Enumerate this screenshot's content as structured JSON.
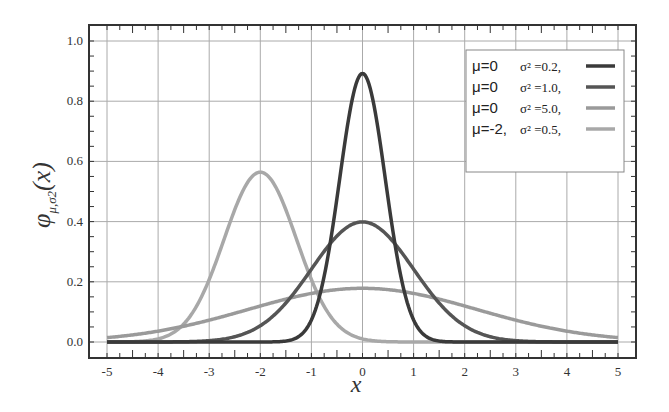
{
  "chart_data": {
    "type": "line",
    "title": "",
    "xlabel": "x",
    "ylabel": "φ μ,σ2 (x)",
    "xlim": [
      -5,
      5
    ],
    "ylim": [
      0,
      1.0
    ],
    "grid": true,
    "legend_position": "upper right",
    "x_ticks": [
      "-5",
      "-4",
      "-3",
      "-2",
      "-1",
      "0",
      "1",
      "2",
      "3",
      "4",
      "5"
    ],
    "y_ticks": [
      "0.0",
      "0.2",
      "0.4",
      "0.6",
      "0.8",
      "1.0"
    ],
    "series": [
      {
        "name": "μ=0  σ² =0.2,",
        "mu": 0,
        "variance": 0.2,
        "color": "#3a3a3a",
        "peak": 0.89
      },
      {
        "name": "μ=0  σ² =1.0,",
        "mu": 0,
        "variance": 1.0,
        "color": "#555555",
        "peak": 0.4
      },
      {
        "name": "μ=0  σ² =5.0,",
        "mu": 0,
        "variance": 5.0,
        "color": "#9a9a9a",
        "peak": 0.18
      },
      {
        "name": "μ=-2, σ² =0.5,",
        "mu": -2,
        "variance": 0.5,
        "color": "#a8a8a8",
        "peak": 0.56
      }
    ],
    "legend": [
      {
        "mu": "μ=0",
        "sigma": "σ² =0.2,"
      },
      {
        "mu": "μ=0",
        "sigma": "σ² =1.0,"
      },
      {
        "mu": "μ=0",
        "sigma": "σ² =5.0,"
      },
      {
        "mu": "μ=-2,",
        "sigma": "σ² =0.5,"
      }
    ]
  }
}
